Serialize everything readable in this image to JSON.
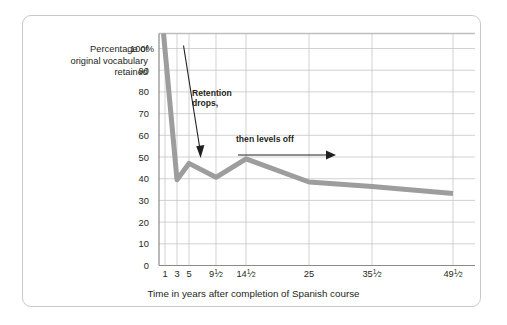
{
  "figure": {
    "frame_color": "#c9c9c9",
    "background": "#ffffff"
  },
  "axis_titles": {
    "y_line1": "Percentage of",
    "y_line2": "original vocabulary",
    "y_line3": "retained",
    "x": "Time in years after completion of Spanish course"
  },
  "annotations": {
    "a1_line1": "Retention",
    "a1_line2": "drops,",
    "a2": "then levels off"
  },
  "chart_data": {
    "type": "line",
    "title": "",
    "xlabel": "Time in years after completion of Spanish course",
    "ylabel": "Percentage of original vocabulary retained",
    "x_tick_labels": [
      "1",
      "3",
      "5",
      "9½",
      "14½",
      "25",
      "35½",
      "49½"
    ],
    "x": [
      1,
      3,
      5,
      9.5,
      14.5,
      25,
      35.5,
      49.5
    ],
    "y_tick_labels": [
      "0",
      "10",
      "20",
      "30",
      "40",
      "50",
      "60",
      "70",
      "80",
      "90",
      "100%"
    ],
    "y_ticks": [
      0,
      10,
      20,
      30,
      40,
      50,
      60,
      70,
      80,
      90,
      100
    ],
    "ylim": [
      0,
      100
    ],
    "xlim": [
      0,
      53
    ],
    "values": [
      100,
      37,
      44,
      38,
      46,
      36,
      34,
      31
    ],
    "series": [
      {
        "name": "Percentage of original vocabulary retained",
        "color": "#9d9d9d",
        "line_width": 5,
        "values": [
          100,
          37,
          44,
          38,
          46,
          36,
          34,
          31
        ]
      }
    ],
    "grid": true,
    "grid_color": "#bfbfbf",
    "legend": "none",
    "annotations": [
      {
        "text": "Retention drops,",
        "arrow": "down"
      },
      {
        "text": "then levels off",
        "arrow": "right"
      }
    ]
  }
}
